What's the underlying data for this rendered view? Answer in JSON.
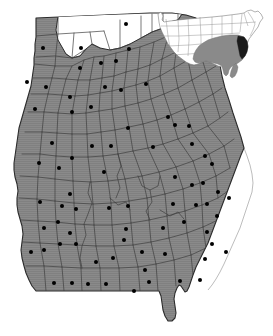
{
  "figure": {
    "width": 273,
    "height": 336,
    "background_color": "#ffffff"
  },
  "colors": {
    "state_fill": "#808080",
    "state_fill_texture": "#8c8c8c",
    "county_border": "#3a3a3a",
    "state_border": "#2b2b2b",
    "unshaded_county_fill": "#ffffff",
    "dot_color": "#000000",
    "coastline_color": "#b4b4b4",
    "inset_fill": "#ffffff",
    "inset_border": "#707070",
    "inset_region_fill": "#8a8a8a",
    "inset_highlight_fill": "#1a1a1a"
  },
  "legend": {
    "shaded_meaning": "county in study region",
    "unshaded_meaning": "county not in study region",
    "dot_meaning": "county seat / sample location"
  },
  "main_map": {
    "name": "Georgia",
    "shaded_region_label": "study area counties (gray)",
    "unshaded_region_label": "northwest counties (white)",
    "dot_count": 107,
    "county_count": 159
  },
  "inset_map": {
    "name": "United States",
    "highlighted_state": "Georgia",
    "shaded_states": [
      "Kentucky",
      "Tennessee",
      "Mississippi",
      "Alabama",
      "Georgia",
      "Florida",
      "South Carolina",
      "North Carolina",
      "Virginia",
      "Arkansas",
      "Louisiana"
    ],
    "highlight_label": "Georgia (dark)"
  },
  "chart_data": {
    "type": "map",
    "state_outline": "M 36,18 L 150,13 L 150,13 L 170,12 L 172,14 L 185,15 L 196,17 L 197,22 L 194,28 L 196,36 L 200,41 L 206,44 L 212,48 L 216,55 L 219,62 L 221,72 L 223,85 L 226,96 L 230,108 L 234,120 L 238,131 L 242,142 L 244,150 L 240,157 L 238,165 L 236,172 L 233,180 L 229,188 L 226,196 L 223,204 L 220,212 L 217,220 L 214,228 L 211,236 L 208,244 L 205,252 L 201,260 L 197,268 L 194,276 L 192,282 L 190,288 L 189,292 L 186,294 L 184,292 L 182,288 L 180,285 L 177,287 L 175,291 L 174,296 L 174,302 L 175,308 L 176,314 L 175,319 L 172,322 L 168,322 L 165,318 L 163,312 L 162,306 L 161,300 L 160,294 L 158,291 L 152,291 L 140,291 L 128,291 L 116,291 L 104,291 L 92,291 L 80,291 L 68,291 L 56,291 L 44,291 L 38,291 L 34,288 L 31,282 L 28,276 L 25,270 L 23,263 L 22,256 L 21,248 L 22,240 L 23,232 L 22,225 L 20,218 L 18,211 L 17,204 L 17,197 L 18,190 L 17,183 L 15,176 L 14,169 L 14,162 L 15,155 L 16,148 L 17,141 L 18,134 L 19,127 L 21,120 L 23,113 L 25,106 L 27,99 L 29,92 L 31,85 L 32,78 L 33,71 L 34,64 L 34,57 L 35,50 L 35,43 L 36,36 L 36,27 Z",
    "dots": [
      {
        "x": 43,
        "y": 48
      },
      {
        "x": 81,
        "y": 48
      },
      {
        "x": 126,
        "y": 24
      },
      {
        "x": 27,
        "y": 82
      },
      {
        "x": 46,
        "y": 87
      },
      {
        "x": 80,
        "y": 68
      },
      {
        "x": 101,
        "y": 63
      },
      {
        "x": 116,
        "y": 61
      },
      {
        "x": 129,
        "y": 49
      },
      {
        "x": 35,
        "y": 109
      },
      {
        "x": 70,
        "y": 97
      },
      {
        "x": 72,
        "y": 112
      },
      {
        "x": 91,
        "y": 107
      },
      {
        "x": 105,
        "y": 87
      },
      {
        "x": 121,
        "y": 90
      },
      {
        "x": 146,
        "y": 84
      },
      {
        "x": 168,
        "y": 117
      },
      {
        "x": 189,
        "y": 126
      },
      {
        "x": 52,
        "y": 143
      },
      {
        "x": 72,
        "y": 158
      },
      {
        "x": 92,
        "y": 146
      },
      {
        "x": 111,
        "y": 146
      },
      {
        "x": 128,
        "y": 128
      },
      {
        "x": 153,
        "y": 147
      },
      {
        "x": 175,
        "y": 125
      },
      {
        "x": 192,
        "y": 144
      },
      {
        "x": 205,
        "y": 156
      },
      {
        "x": 212,
        "y": 164
      },
      {
        "x": 39,
        "y": 163
      },
      {
        "x": 59,
        "y": 168
      },
      {
        "x": 70,
        "y": 194
      },
      {
        "x": 40,
        "y": 202
      },
      {
        "x": 62,
        "y": 206
      },
      {
        "x": 76,
        "y": 209
      },
      {
        "x": 104,
        "y": 172
      },
      {
        "x": 109,
        "y": 208
      },
      {
        "x": 128,
        "y": 206
      },
      {
        "x": 175,
        "y": 177
      },
      {
        "x": 192,
        "y": 185
      },
      {
        "x": 203,
        "y": 183
      },
      {
        "x": 173,
        "y": 204
      },
      {
        "x": 196,
        "y": 205
      },
      {
        "x": 207,
        "y": 204
      },
      {
        "x": 218,
        "y": 192
      },
      {
        "x": 229,
        "y": 198
      },
      {
        "x": 44,
        "y": 228
      },
      {
        "x": 58,
        "y": 222
      },
      {
        "x": 70,
        "y": 233
      },
      {
        "x": 31,
        "y": 252
      },
      {
        "x": 44,
        "y": 250
      },
      {
        "x": 60,
        "y": 244
      },
      {
        "x": 76,
        "y": 244
      },
      {
        "x": 96,
        "y": 262
      },
      {
        "x": 126,
        "y": 229
      },
      {
        "x": 124,
        "y": 240
      },
      {
        "x": 142,
        "y": 252
      },
      {
        "x": 165,
        "y": 254
      },
      {
        "x": 163,
        "y": 228
      },
      {
        "x": 184,
        "y": 222
      },
      {
        "x": 207,
        "y": 232
      },
      {
        "x": 217,
        "y": 216
      },
      {
        "x": 212,
        "y": 244
      },
      {
        "x": 226,
        "y": 252
      },
      {
        "x": 54,
        "y": 283
      },
      {
        "x": 72,
        "y": 283
      },
      {
        "x": 88,
        "y": 284
      },
      {
        "x": 106,
        "y": 284
      },
      {
        "x": 134,
        "y": 291
      },
      {
        "x": 149,
        "y": 282
      },
      {
        "x": 180,
        "y": 281
      },
      {
        "x": 200,
        "y": 280
      },
      {
        "x": 205,
        "y": 259
      },
      {
        "x": 145,
        "y": 270
      },
      {
        "x": 113,
        "y": 258
      }
    ],
    "dot_radius": 2.0,
    "legend": "off",
    "grid": "off"
  }
}
